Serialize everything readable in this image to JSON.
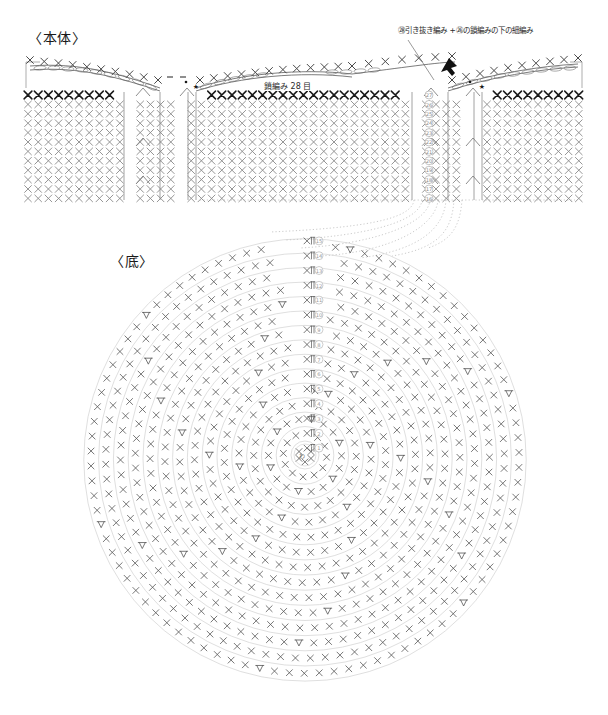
{
  "document": {
    "kind": "crochet-pattern-chart",
    "language": "ja"
  },
  "sections": {
    "body": {
      "title": "〈本体〉",
      "chain_label": "鎖編み 28 目",
      "annotation": "㉘引き抜き編み +㉖の鎖編みの下の細編み",
      "row_numbers": [
        "㉗",
        "㉖",
        "㉕",
        "㉔",
        "㉓",
        "㉒",
        "㉑",
        "⑳",
        "⑲",
        "⑱",
        "⑰",
        "⑯"
      ],
      "rows_total": 12,
      "stitch_symbol": "×",
      "highlight_row_color": "#1a1a1a",
      "body_row_color": "#8a8a8a"
    },
    "base": {
      "title": "〈底〉",
      "center_label": "わ",
      "round_numbers": [
        "①",
        "②",
        "③",
        "④",
        "⑤",
        "⑥",
        "⑦",
        "⑧",
        "⑨",
        "⑩",
        "⑪",
        "⑫",
        "⑬",
        "⑭",
        "⑮"
      ],
      "rounds_total": 15,
      "stitch_symbol": "×",
      "increase_symbol": "V",
      "round_line_color": "#c9c9c9",
      "stitch_color": "#555555"
    }
  },
  "legend": {
    "star_symbol": "★",
    "chain_symbol": "◠",
    "slip_stitch_symbol": "•"
  },
  "chart_data": {
    "type": "diagram",
    "base_rounds": [
      {
        "round": "①",
        "stitches": 6
      },
      {
        "round": "②",
        "stitches": 12
      },
      {
        "round": "③",
        "stitches": 18
      },
      {
        "round": "④",
        "stitches": 24
      },
      {
        "round": "⑤",
        "stitches": 30
      },
      {
        "round": "⑥",
        "stitches": 36
      },
      {
        "round": "⑦",
        "stitches": 42
      },
      {
        "round": "⑧",
        "stitches": 48
      },
      {
        "round": "⑨",
        "stitches": 54
      },
      {
        "round": "⑩",
        "stitches": 60
      },
      {
        "round": "⑪",
        "stitches": 66
      },
      {
        "round": "⑫",
        "stitches": 72
      },
      {
        "round": "⑬",
        "stitches": 78
      },
      {
        "round": "⑭",
        "stitches": 84
      },
      {
        "round": "⑮",
        "stitches": 90
      }
    ],
    "body_rows": [
      "⑯",
      "⑰",
      "⑱",
      "⑲",
      "⑳",
      "㉑",
      "㉒",
      "㉓",
      "㉔",
      "㉕",
      "㉖",
      "㉗"
    ],
    "chain_count": 28
  }
}
